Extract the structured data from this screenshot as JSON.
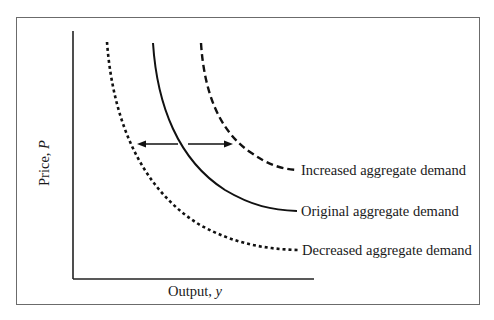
{
  "diagram": {
    "type": "aggregate-demand-shift",
    "axes": {
      "y_label": "Price, ",
      "y_var": "P",
      "x_label": "Output, ",
      "x_var": "y"
    },
    "curves": [
      {
        "name": "Increased aggregate demand",
        "style": "dashed",
        "position": "right"
      },
      {
        "name": "Original aggregate demand",
        "style": "solid",
        "position": "middle"
      },
      {
        "name": "Decreased aggregate demand",
        "style": "dotted",
        "position": "left"
      }
    ],
    "arrows": [
      {
        "direction": "left",
        "meaning": "shift to decreased demand"
      },
      {
        "direction": "right",
        "meaning": "shift to increased demand"
      }
    ],
    "colors": {
      "line": "#111111",
      "frame": "#6b6b6b",
      "background": "#ffffff"
    }
  }
}
